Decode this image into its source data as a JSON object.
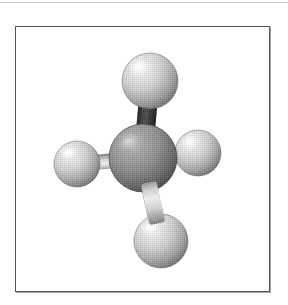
{
  "page": {
    "background_color": "#ffffff",
    "width": 288,
    "height": 305,
    "top_rule_color": "#c9c9c9"
  },
  "figure": {
    "name": "methane-ball-and-stick-model",
    "caption": "",
    "frame": {
      "border_color": "#555555",
      "fill_color": "#ffffff",
      "shadow_color": "#a8a8a8",
      "x": 15,
      "y": 26,
      "width": 255,
      "height": 266
    },
    "render_style": "halftone-dithered-grayscale",
    "palette": {
      "central_atom_light": "#b4b4b4",
      "central_atom_mid": "#8a8a8a",
      "central_atom_dark": "#4a4a4a",
      "terminal_atom_light": "#fbfbfb",
      "terminal_atom_mid": "#c8c8c8",
      "terminal_atom_dark": "#6e6e6e",
      "bond_light": "#e6e6e6",
      "bond_mid": "#bdbdbd",
      "bond_dark": "#2e2e2e",
      "outline": "#3a3a3a"
    },
    "atoms": [
      {
        "id": "central-atom",
        "label": "C",
        "role": "central",
        "cx": 127,
        "cy": 131,
        "r": 34,
        "highlight_x": 112,
        "highlight_y": 114,
        "shade": "central"
      },
      {
        "id": "terminal-atom-top",
        "label": "H",
        "role": "terminal",
        "cx": 134,
        "cy": 54,
        "r": 28,
        "highlight_x": 122,
        "highlight_y": 40,
        "shade": "terminal"
      },
      {
        "id": "terminal-atom-left",
        "label": "H",
        "role": "terminal",
        "cx": 61,
        "cy": 137,
        "r": 23,
        "highlight_x": 52,
        "highlight_y": 126,
        "shade": "terminal"
      },
      {
        "id": "terminal-atom-right",
        "label": "H",
        "role": "terminal",
        "cx": 182,
        "cy": 126,
        "r": 23,
        "highlight_x": 173,
        "highlight_y": 114,
        "shade": "terminal"
      },
      {
        "id": "terminal-atom-bottom",
        "label": "H",
        "role": "terminal",
        "cx": 145,
        "cy": 214,
        "r": 27,
        "highlight_x": 133,
        "highlight_y": 200,
        "shade": "terminal"
      }
    ],
    "bonds": [
      {
        "id": "bond-top",
        "from": "central-atom",
        "to": "terminal-atom-top",
        "x1": 127,
        "y1": 131,
        "x2": 134,
        "y2": 54,
        "width": 19,
        "shade": "dark"
      },
      {
        "id": "bond-left",
        "from": "central-atom",
        "to": "terminal-atom-left",
        "x1": 127,
        "y1": 131,
        "x2": 61,
        "y2": 137,
        "width": 15,
        "shade": "light"
      },
      {
        "id": "bond-right",
        "from": "central-atom",
        "to": "terminal-atom-right",
        "x1": 127,
        "y1": 131,
        "x2": 182,
        "y2": 126,
        "width": 15,
        "shade": "light"
      },
      {
        "id": "bond-bottom",
        "from": "central-atom",
        "to": "terminal-atom-bottom",
        "x1": 127,
        "y1": 131,
        "x2": 145,
        "y2": 214,
        "width": 16,
        "shade": "light"
      }
    ]
  }
}
